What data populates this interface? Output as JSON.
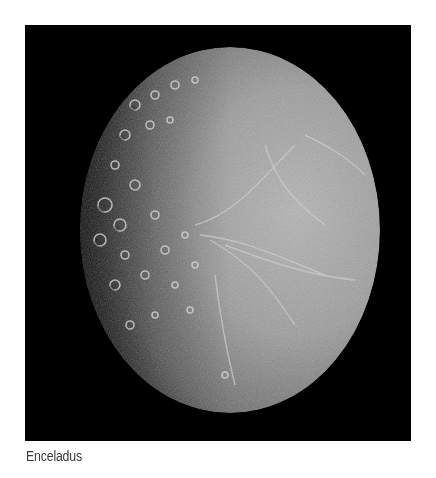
{
  "figure": {
    "caption": "Enceladus",
    "background_color": "#000000",
    "surface_color": "#9a9a9a"
  }
}
